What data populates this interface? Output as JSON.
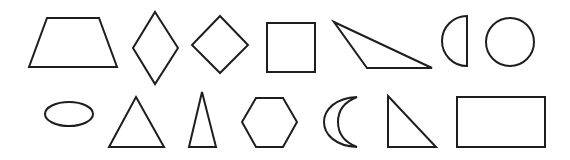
{
  "figure": {
    "stroke_color": "#1e1e1e",
    "background_color": "#ffffff",
    "rows": [
      {
        "shapes": [
          {
            "name": "trapezoid"
          },
          {
            "name": "rhombus"
          },
          {
            "name": "diamond-square"
          },
          {
            "name": "square"
          },
          {
            "name": "obtuse-triangle"
          },
          {
            "name": "semicircle"
          },
          {
            "name": "circle"
          }
        ]
      },
      {
        "shapes": [
          {
            "name": "oval"
          },
          {
            "name": "triangle"
          },
          {
            "name": "isosceles-triangle"
          },
          {
            "name": "hexagon"
          },
          {
            "name": "crescent"
          },
          {
            "name": "right-triangle"
          },
          {
            "name": "rectangle"
          }
        ]
      }
    ]
  }
}
